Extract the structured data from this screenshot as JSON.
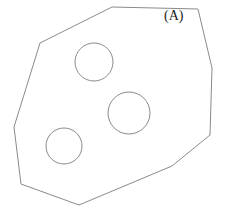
{
  "figure": {
    "label": "(A)",
    "stroke_color": "#8a8a8a",
    "background": "#ffffff",
    "outline_polygon": {
      "points": [
        [
          112,
          7
        ],
        [
          198,
          9
        ],
        [
          212,
          68
        ],
        [
          210,
          135
        ],
        [
          172,
          166
        ],
        [
          79,
          205
        ],
        [
          21,
          184
        ],
        [
          14,
          127
        ],
        [
          40,
          43
        ]
      ]
    },
    "circles": [
      {
        "cx": 94,
        "cy": 62,
        "r": 19
      },
      {
        "cx": 129,
        "cy": 113,
        "r": 21
      },
      {
        "cx": 64,
        "cy": 146,
        "r": 18
      }
    ]
  }
}
